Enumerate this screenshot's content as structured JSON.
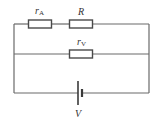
{
  "diagram": {
    "type": "circuit",
    "components": [
      {
        "id": "rA",
        "kind": "resistor",
        "label": "r",
        "subscript": "A",
        "branch": "top"
      },
      {
        "id": "R",
        "kind": "resistor",
        "label": "R",
        "subscript": "",
        "branch": "top"
      },
      {
        "id": "rV",
        "kind": "resistor",
        "label": "r",
        "subscript": "V",
        "branch": "middle"
      },
      {
        "id": "V",
        "kind": "battery",
        "label": "V",
        "branch": "bottom"
      }
    ],
    "labels": {
      "rA_main": "r",
      "rA_sub": "A",
      "R": "R",
      "rV_main": "r",
      "rV_sub": "V",
      "V": "V"
    },
    "colors": {
      "wire": "#6a6a6a",
      "component": "#4a4a4a",
      "text": "#333333",
      "background": "#ffffff"
    }
  }
}
